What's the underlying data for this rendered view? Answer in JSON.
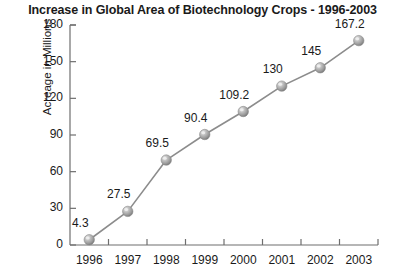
{
  "chart_data": {
    "type": "line",
    "title": "Increase in Global Area of Biotechnology Crops - 1996-2003",
    "xlabel": "",
    "ylabel": "Acreage in Millions",
    "categories": [
      "1996",
      "1997",
      "1998",
      "1999",
      "2000",
      "2001",
      "2002",
      "2003"
    ],
    "values": [
      4.3,
      27.5,
      69.5,
      90.4,
      109.2,
      130,
      145,
      167.2
    ],
    "point_labels": [
      "4.3",
      "27.5",
      "69.5",
      "90.4",
      "109.2",
      "130",
      "145",
      "167.2"
    ],
    "ylim": [
      0,
      180
    ],
    "yticks": [
      0,
      30,
      60,
      90,
      120,
      150,
      180
    ],
    "ytick_labels": [
      "0",
      "30",
      "60",
      "90",
      "120",
      "150",
      "180"
    ],
    "grid": false,
    "legend": false,
    "marker": "sphere",
    "line_color": "#8c8c8c",
    "marker_color": "#a8a8a8",
    "axis_color": "#6e6e6e",
    "text_color": "#1a1a1a",
    "background": "#ffffff"
  }
}
